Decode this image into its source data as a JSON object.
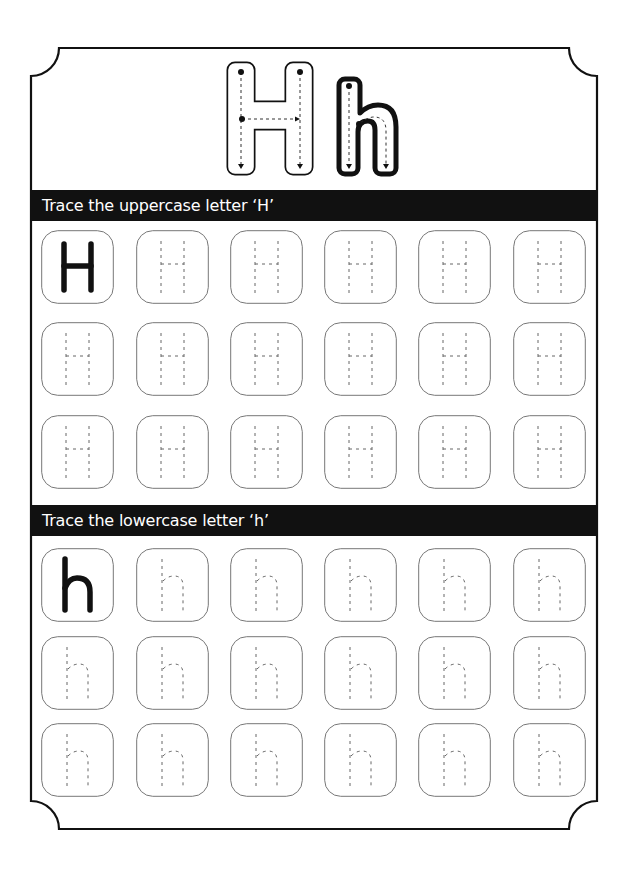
{
  "worksheet": {
    "hero": {
      "uppercase": "H",
      "lowercase": "h"
    },
    "sections": [
      {
        "title": "Trace the uppercase letter ‘H’",
        "letter": "H",
        "rows": 3,
        "cols": 6,
        "model_cell": "solid"
      },
      {
        "title": "Trace the lowercase letter ‘h’",
        "letter": "h",
        "rows": 3,
        "cols": 6,
        "model_cell": "solid"
      }
    ],
    "colors": {
      "ink": "#111111",
      "box_border": "#777777",
      "guide": "#666666",
      "background": "#ffffff"
    }
  }
}
